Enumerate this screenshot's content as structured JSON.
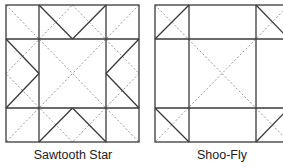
{
  "diagrams": [
    {
      "name": "sawtooth-star",
      "label": "Sawtooth Star"
    },
    {
      "name": "shoo-fly",
      "label": "Shoo-Fly"
    }
  ],
  "colors": {
    "line": "#3a3a3a",
    "dotted": "#9a9a9a"
  }
}
